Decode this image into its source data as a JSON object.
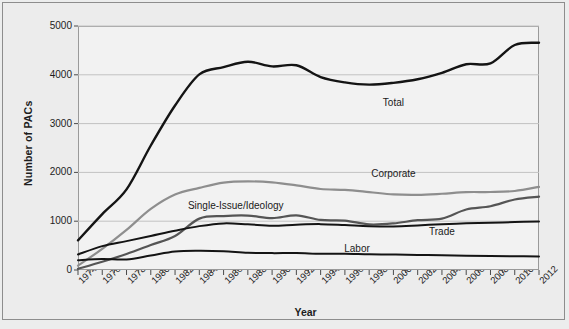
{
  "chart_data": {
    "type": "line",
    "title": "",
    "xlabel": "Year",
    "ylabel": "Number of PACs",
    "xlim": [
      1974,
      2012
    ],
    "ylim": [
      0,
      5000
    ],
    "grid": true,
    "legend_position": "inline-labels",
    "x": [
      1974,
      1976,
      1978,
      1980,
      1982,
      1984,
      1986,
      1988,
      1990,
      1992,
      1994,
      1996,
      1998,
      2000,
      2002,
      2004,
      2006,
      2008,
      2010,
      2012
    ],
    "ytick_labels": [
      "0",
      "1000",
      "2000",
      "3000",
      "4000",
      "5000"
    ],
    "ytick_values": [
      0,
      1000,
      2000,
      3000,
      4000,
      5000
    ],
    "xtick_labels": [
      "1974",
      "1976",
      "1978",
      "1980",
      "1982",
      "1984",
      "1986",
      "1988",
      "1990",
      "1992",
      "1994",
      "1996",
      "1998",
      "2000",
      "2002",
      "2004",
      "2006",
      "2008",
      "2010",
      "2012"
    ],
    "series": [
      {
        "name": "Total",
        "label": "Total",
        "color": "#141414",
        "width": 2.4,
        "label_x": 2000,
        "label_y": 3420,
        "values": [
          608,
          1146,
          1653,
          2551,
          3371,
          4009,
          4157,
          4268,
          4172,
          4195,
          3954,
          3844,
          3798,
          3835,
          3908,
          4040,
          4217,
          4234,
          4611,
          4657
        ]
      },
      {
        "name": "Corporate",
        "label": "Corporate",
        "color": "#8e8e8e",
        "width": 2.2,
        "label_x": 2000,
        "label_y": 1960,
        "values": [
          89,
          433,
          821,
          1251,
          1546,
          1682,
          1792,
          1816,
          1795,
          1735,
          1660,
          1642,
          1597,
          1548,
          1539,
          1563,
          1596,
          1598,
          1619,
          1704
        ]
      },
      {
        "name": "Single-Issue/Ideology",
        "label": "Single-Issue/Ideology",
        "color": "#555555",
        "width": 2.2,
        "label_x": 1987,
        "label_y": 1320,
        "values": [
          24,
          168,
          328,
          512,
          698,
          1053,
          1105,
          1115,
          1062,
          1121,
          1026,
          1013,
          935,
          955,
          1021,
          1053,
          1240,
          1306,
          1445,
          1503
        ]
      },
      {
        "name": "Trade",
        "label": "Trade",
        "color": "#141414",
        "width": 2.0,
        "label_x": 2004,
        "label_y": 780,
        "values": [
          318,
          489,
          592,
          698,
          805,
          899,
          955,
          936,
          907,
          929,
          940,
          921,
          899,
          893,
          913,
          939,
          956,
          968,
          983,
          995
        ]
      },
      {
        "name": "Labor",
        "label": "Labor",
        "color": "#141414",
        "width": 2.0,
        "label_x": 1997,
        "label_y": 430,
        "values": [
          201,
          224,
          217,
          297,
          380,
          394,
          384,
          354,
          346,
          347,
          333,
          332,
          321,
          316,
          308,
          302,
          290,
          285,
          281,
          279
        ]
      }
    ]
  }
}
